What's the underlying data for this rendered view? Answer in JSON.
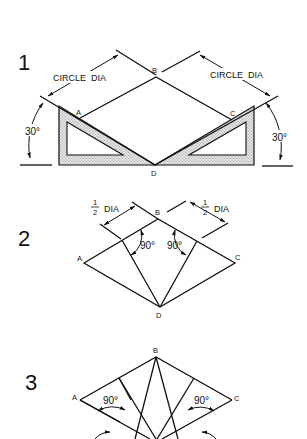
{
  "figure1": {
    "step": "1",
    "dim_left": "CIRCLE  DIA",
    "dim_right": "CIRCLE  DIA",
    "angle_left": "30°",
    "angle_right": "30°",
    "points": {
      "A": "A",
      "B": "B",
      "C": "C",
      "D": "D"
    }
  },
  "figure2": {
    "step": "2",
    "dim_left_num": "1",
    "dim_left_den": "2",
    "dim_left_text": "DIA",
    "dim_right_num": "1",
    "dim_right_den": "2",
    "dim_right_text": "DIA",
    "angle_left": "90°",
    "angle_right": "90°",
    "points": {
      "A": "A",
      "B": "B",
      "C": "C",
      "D": "D"
    }
  },
  "figure3": {
    "step": "3",
    "angle_left": "90°",
    "angle_right": "90°",
    "points": {
      "A": "A",
      "B": "B",
      "C": "C"
    }
  },
  "colors": {
    "ink": "#111111",
    "shade": "#cfcfcf",
    "background": "#ffffff"
  }
}
